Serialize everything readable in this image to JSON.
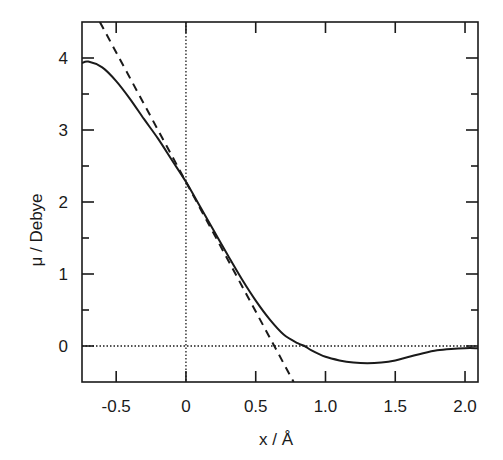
{
  "chart_data": {
    "type": "line",
    "title": "",
    "xlabel": "x / Å",
    "ylabel": "μ / Debye",
    "xlim": [
      -0.745,
      2.093
    ],
    "ylim": [
      -0.5,
      4.5
    ],
    "grid": false,
    "legend": null,
    "xticks": [
      -0.5,
      0,
      0.5,
      1.0,
      1.5,
      2.0
    ],
    "xtick_labels": [
      "-0.5",
      "0",
      "0.5",
      "1.0",
      "1.5",
      "2.0"
    ],
    "yticks": [
      0,
      1,
      2,
      3,
      4
    ],
    "ytick_labels": [
      "0",
      "1",
      "2",
      "3",
      "4"
    ],
    "yminor_ticks": [
      0.5,
      1.5,
      2.5,
      3.5
    ],
    "reference_lines": [
      {
        "orientation": "vertical",
        "value": 0,
        "style": "dotted"
      },
      {
        "orientation": "horizontal",
        "value": 0,
        "style": "dotted"
      }
    ],
    "series": [
      {
        "name": "dipole moment curve",
        "style": "solid",
        "x": [
          -0.745,
          -0.7,
          -0.6,
          -0.5,
          -0.4,
          -0.3,
          -0.2,
          -0.1,
          0.0,
          0.1,
          0.2,
          0.3,
          0.4,
          0.5,
          0.6,
          0.7,
          0.8,
          0.85,
          0.9,
          1.0,
          1.1,
          1.2,
          1.3,
          1.4,
          1.5,
          1.6,
          1.7,
          1.8,
          1.9,
          2.0,
          2.093
        ],
        "y": [
          3.93,
          3.95,
          3.87,
          3.68,
          3.43,
          3.15,
          2.88,
          2.58,
          2.28,
          1.94,
          1.6,
          1.26,
          0.93,
          0.63,
          0.37,
          0.16,
          0.04,
          0.0,
          -0.06,
          -0.15,
          -0.2,
          -0.23,
          -0.24,
          -0.23,
          -0.2,
          -0.15,
          -0.1,
          -0.06,
          -0.04,
          -0.03,
          -0.03
        ]
      },
      {
        "name": "linear tangent at x=0",
        "style": "dashed",
        "x": [
          -0.617,
          0.772
        ],
        "y": [
          4.5,
          -0.5
        ]
      }
    ]
  }
}
